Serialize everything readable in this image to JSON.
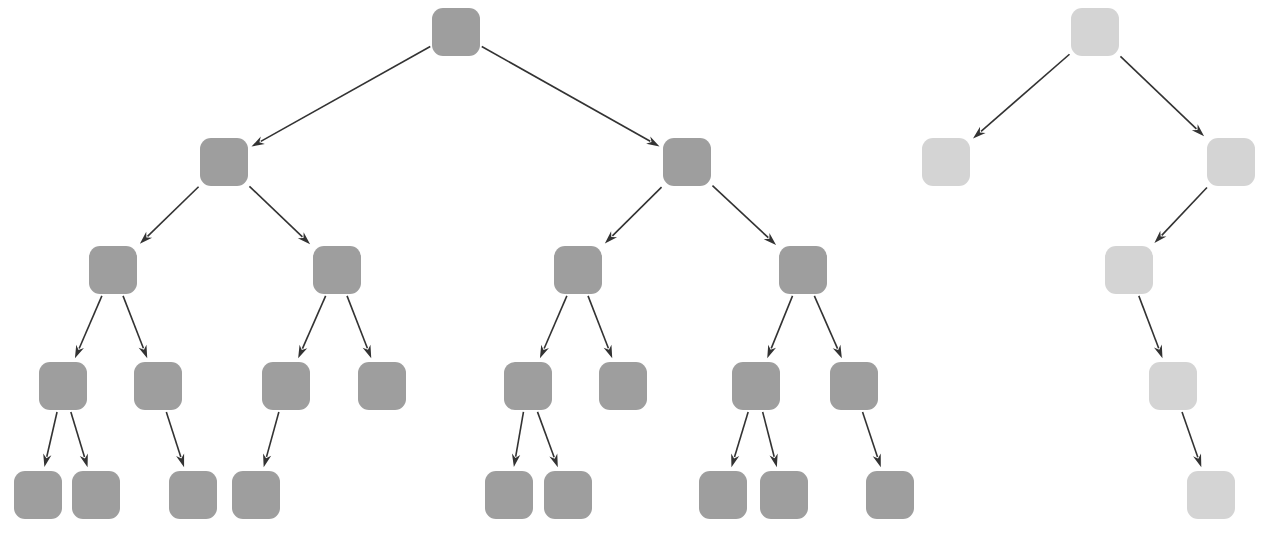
{
  "diagram": {
    "type": "tree-diagram",
    "background_color": "#ffffff",
    "canvas": {
      "width": 1264,
      "height": 552
    },
    "node_shape": "rounded-square",
    "node_corner_radius": 11,
    "edge_style": "straight-arrow",
    "edge_color": "#333333",
    "edge_width": 1.6,
    "arrowhead": "solid-triangle",
    "label_text": "",
    "trees": [
      {
        "id": "left-tree",
        "name": "dark-tree",
        "fill_color": "#9e9e9e",
        "node_count": 21,
        "depth": 5,
        "root_id": "L0",
        "nodes": [
          {
            "id": "L0",
            "label": "",
            "level": 0,
            "cx": 456,
            "cy": 32,
            "w": 48,
            "h": 48
          },
          {
            "id": "L1a",
            "label": "",
            "level": 1,
            "cx": 224,
            "cy": 162,
            "w": 48,
            "h": 48
          },
          {
            "id": "L1b",
            "label": "",
            "level": 1,
            "cx": 687,
            "cy": 162,
            "w": 48,
            "h": 48
          },
          {
            "id": "L2a",
            "label": "",
            "level": 2,
            "cx": 113,
            "cy": 270,
            "w": 48,
            "h": 48
          },
          {
            "id": "L2b",
            "label": "",
            "level": 2,
            "cx": 337,
            "cy": 270,
            "w": 48,
            "h": 48
          },
          {
            "id": "L2c",
            "label": "",
            "level": 2,
            "cx": 578,
            "cy": 270,
            "w": 48,
            "h": 48
          },
          {
            "id": "L2d",
            "label": "",
            "level": 2,
            "cx": 803,
            "cy": 270,
            "w": 48,
            "h": 48
          },
          {
            "id": "L3a",
            "label": "",
            "level": 3,
            "cx": 63,
            "cy": 386,
            "w": 48,
            "h": 48
          },
          {
            "id": "L3b",
            "label": "",
            "level": 3,
            "cx": 158,
            "cy": 386,
            "w": 48,
            "h": 48
          },
          {
            "id": "L3c",
            "label": "",
            "level": 3,
            "cx": 286,
            "cy": 386,
            "w": 48,
            "h": 48
          },
          {
            "id": "L3d",
            "label": "",
            "level": 3,
            "cx": 382,
            "cy": 386,
            "w": 48,
            "h": 48
          },
          {
            "id": "L3e",
            "label": "",
            "level": 3,
            "cx": 528,
            "cy": 386,
            "w": 48,
            "h": 48
          },
          {
            "id": "L3f",
            "label": "",
            "level": 3,
            "cx": 623,
            "cy": 386,
            "w": 48,
            "h": 48
          },
          {
            "id": "L3g",
            "label": "",
            "level": 3,
            "cx": 756,
            "cy": 386,
            "w": 48,
            "h": 48
          },
          {
            "id": "L3h",
            "label": "",
            "level": 3,
            "cx": 854,
            "cy": 386,
            "w": 48,
            "h": 48
          },
          {
            "id": "L4a",
            "label": "",
            "level": 4,
            "cx": 38,
            "cy": 495,
            "w": 48,
            "h": 48
          },
          {
            "id": "L4b",
            "label": "",
            "level": 4,
            "cx": 96,
            "cy": 495,
            "w": 48,
            "h": 48
          },
          {
            "id": "L4c",
            "label": "",
            "level": 4,
            "cx": 193,
            "cy": 495,
            "w": 48,
            "h": 48
          },
          {
            "id": "L4d",
            "label": "",
            "level": 4,
            "cx": 256,
            "cy": 495,
            "w": 48,
            "h": 48
          },
          {
            "id": "L4e",
            "label": "",
            "level": 4,
            "cx": 509,
            "cy": 495,
            "w": 48,
            "h": 48
          },
          {
            "id": "L4f",
            "label": "",
            "level": 4,
            "cx": 568,
            "cy": 495,
            "w": 48,
            "h": 48
          },
          {
            "id": "L4g",
            "label": "",
            "level": 4,
            "cx": 723,
            "cy": 495,
            "w": 48,
            "h": 48
          },
          {
            "id": "L4h",
            "label": "",
            "level": 4,
            "cx": 784,
            "cy": 495,
            "w": 48,
            "h": 48
          },
          {
            "id": "L4i",
            "label": "",
            "level": 4,
            "cx": 890,
            "cy": 495,
            "w": 48,
            "h": 48
          }
        ],
        "edges": [
          {
            "from": "L0",
            "to": "L1a"
          },
          {
            "from": "L0",
            "to": "L1b"
          },
          {
            "from": "L1a",
            "to": "L2a"
          },
          {
            "from": "L1a",
            "to": "L2b"
          },
          {
            "from": "L1b",
            "to": "L2c"
          },
          {
            "from": "L1b",
            "to": "L2d"
          },
          {
            "from": "L2a",
            "to": "L3a"
          },
          {
            "from": "L2a",
            "to": "L3b"
          },
          {
            "from": "L2b",
            "to": "L3c"
          },
          {
            "from": "L2b",
            "to": "L3d"
          },
          {
            "from": "L2c",
            "to": "L3e"
          },
          {
            "from": "L2c",
            "to": "L3f"
          },
          {
            "from": "L2d",
            "to": "L3g"
          },
          {
            "from": "L2d",
            "to": "L3h"
          },
          {
            "from": "L3a",
            "to": "L4a"
          },
          {
            "from": "L3a",
            "to": "L4b"
          },
          {
            "from": "L3b",
            "to": "L4c"
          },
          {
            "from": "L3c",
            "to": "L4d"
          },
          {
            "from": "L3e",
            "to": "L4e"
          },
          {
            "from": "L3e",
            "to": "L4f"
          },
          {
            "from": "L3g",
            "to": "L4g"
          },
          {
            "from": "L3g",
            "to": "L4h"
          },
          {
            "from": "L3h",
            "to": "L4i"
          }
        ]
      },
      {
        "id": "right-tree",
        "name": "light-tree",
        "fill_color": "#d4d4d4",
        "node_count": 6,
        "depth": 5,
        "root_id": "R0",
        "nodes": [
          {
            "id": "R0",
            "label": "",
            "level": 0,
            "cx": 1095,
            "cy": 32,
            "w": 48,
            "h": 48
          },
          {
            "id": "R1a",
            "label": "",
            "level": 1,
            "cx": 946,
            "cy": 162,
            "w": 48,
            "h": 48
          },
          {
            "id": "R1b",
            "label": "",
            "level": 1,
            "cx": 1231,
            "cy": 162,
            "w": 48,
            "h": 48
          },
          {
            "id": "R2a",
            "label": "",
            "level": 2,
            "cx": 1129,
            "cy": 270,
            "w": 48,
            "h": 48
          },
          {
            "id": "R3a",
            "label": "",
            "level": 3,
            "cx": 1173,
            "cy": 386,
            "w": 48,
            "h": 48
          },
          {
            "id": "R4a",
            "label": "",
            "level": 4,
            "cx": 1211,
            "cy": 495,
            "w": 48,
            "h": 48
          }
        ],
        "edges": [
          {
            "from": "R0",
            "to": "R1a"
          },
          {
            "from": "R0",
            "to": "R1b"
          },
          {
            "from": "R1b",
            "to": "R2a"
          },
          {
            "from": "R2a",
            "to": "R3a"
          },
          {
            "from": "R3a",
            "to": "R4a"
          }
        ]
      }
    ]
  }
}
